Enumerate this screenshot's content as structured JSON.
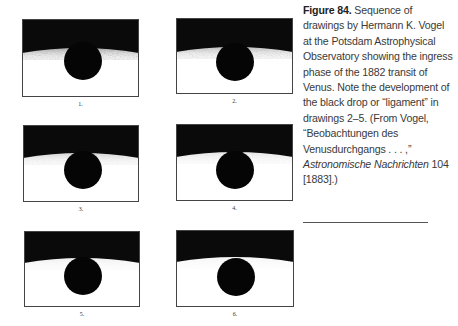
{
  "figure": {
    "number_label": "Figure 84.",
    "caption_parts": [
      "Sequence of drawings by Hermann K. Vogel at the Potsdam Astro­physical Observatory showing the ingress phase of the 1882 transit of Venus. Note the development of the black drop or “ligament” in drawings 2–5. (From Vogel, “Beobachtungen des Venusdurchgangs . . . ,” ",
      "Astronomische Nachrichten",
      " 104 [1883].)"
    ]
  },
  "panels": [
    {
      "label": "1.",
      "x": 22,
      "y": 19,
      "w": 117,
      "h": 78,
      "limb_y": 29,
      "disc_cx": 61,
      "disc_cy": 42,
      "disc_r": 19,
      "ligament": 0,
      "haze": 1.0
    },
    {
      "label": "2.",
      "x": 176,
      "y": 18,
      "w": 117,
      "h": 76,
      "limb_y": 29,
      "disc_cx": 59,
      "disc_cy": 44,
      "disc_r": 19,
      "ligament": 6,
      "haze": 0.7
    },
    {
      "label": "3.",
      "x": 23,
      "y": 125,
      "w": 116,
      "h": 77,
      "limb_y": 28,
      "disc_cx": 60,
      "disc_cy": 45,
      "disc_r": 19,
      "ligament": 4,
      "haze": 0.4
    },
    {
      "label": "4.",
      "x": 176,
      "y": 124,
      "w": 117,
      "h": 77,
      "limb_y": 28,
      "disc_cx": 59,
      "disc_cy": 46,
      "disc_r": 19,
      "ligament": 3,
      "haze": 0.25
    },
    {
      "label": "5.",
      "x": 24,
      "y": 231,
      "w": 116,
      "h": 76,
      "limb_y": 27,
      "disc_cx": 59,
      "disc_cy": 45,
      "disc_r": 19,
      "ligament": 2,
      "haze": 0.15
    },
    {
      "label": "6.",
      "x": 176,
      "y": 230,
      "w": 118,
      "h": 77,
      "limb_y": 27,
      "disc_cx": 60,
      "disc_cy": 47,
      "disc_r": 19,
      "ligament": 0,
      "haze": 0.1
    }
  ],
  "colors": {
    "sky": "#0a0a0a",
    "disc": "#050505",
    "sun": "#ffffff",
    "frame": "#444444"
  }
}
